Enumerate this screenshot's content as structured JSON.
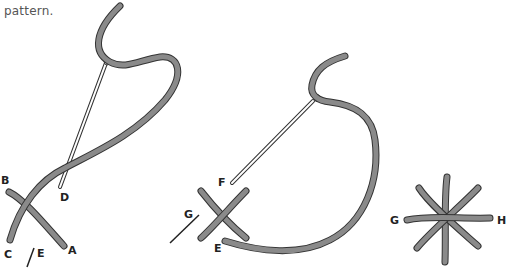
{
  "caption": {
    "text": "pattern."
  },
  "figures": [
    {
      "id": "step-1",
      "labels": {
        "a": "A",
        "b": "B",
        "c": "C",
        "d": "D",
        "e": "E"
      }
    },
    {
      "id": "step-2",
      "labels": {
        "e": "E",
        "f": "F",
        "g": "G"
      }
    },
    {
      "id": "step-3",
      "labels": {
        "g": "G",
        "h": "H"
      }
    }
  ],
  "colors": {
    "thread_fill": "#8a8a8a",
    "thread_outline": "#333333",
    "label": "#222222",
    "text": "#555555"
  }
}
